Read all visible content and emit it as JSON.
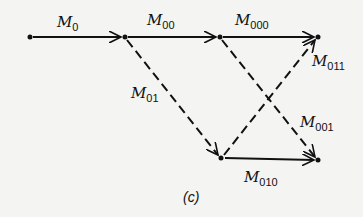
{
  "diagram": {
    "caption": "(c)",
    "nodes": [
      {
        "id": "n0",
        "x": 30,
        "y": 37
      },
      {
        "id": "n1",
        "x": 125,
        "y": 37
      },
      {
        "id": "n2",
        "x": 220,
        "y": 37
      },
      {
        "id": "n3",
        "x": 318,
        "y": 37
      },
      {
        "id": "n4",
        "x": 221,
        "y": 158
      },
      {
        "id": "n5",
        "x": 318,
        "y": 160
      }
    ],
    "edges": [
      {
        "from": "n0",
        "to": "n1",
        "style": "solid",
        "label": "M",
        "sub": "0"
      },
      {
        "from": "n1",
        "to": "n2",
        "style": "solid",
        "label": "M",
        "sub": "00"
      },
      {
        "from": "n2",
        "to": "n3",
        "style": "solid",
        "label": "M",
        "sub": "000"
      },
      {
        "from": "n1",
        "to": "n4",
        "style": "dashed",
        "label": "M",
        "sub": "01"
      },
      {
        "from": "n4",
        "to": "n3",
        "style": "dashed",
        "label": "M",
        "sub": "011"
      },
      {
        "from": "n2",
        "to": "n5",
        "style": "dashed",
        "label": "M",
        "sub": "001"
      },
      {
        "from": "n4",
        "to": "n5",
        "style": "solid",
        "label": "M",
        "sub": "010"
      }
    ]
  }
}
